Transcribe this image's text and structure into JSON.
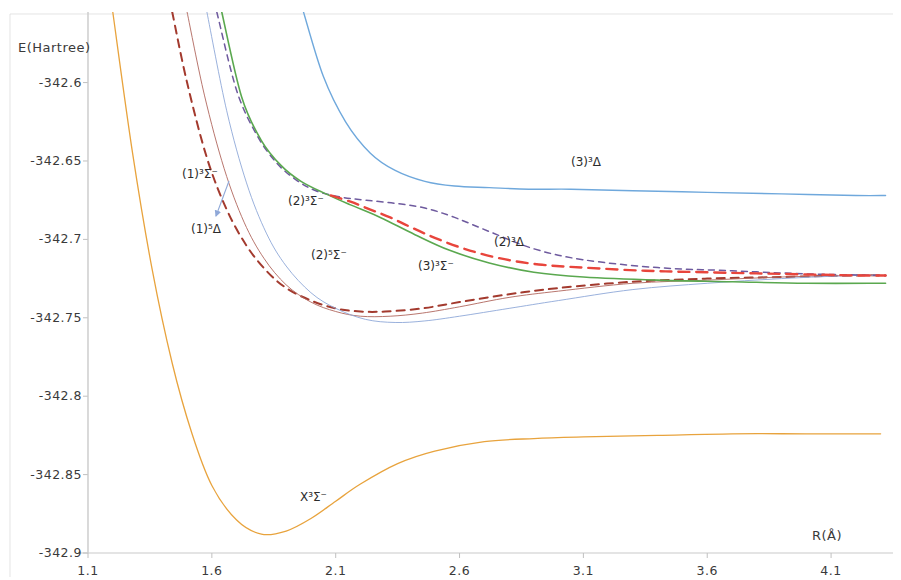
{
  "figure": {
    "background": "#ffffff",
    "ylabel": "E(Hartree)",
    "xlabel": "R(Å)"
  },
  "chart_data": {
    "type": "line",
    "title": "",
    "subtitle": "",
    "xlabel": "R(Å)",
    "ylabel": "E(Hartree)",
    "xlim": [
      1.1,
      4.35
    ],
    "ylim": [
      -342.9,
      -342.555
    ],
    "xticks": [
      "1.1",
      "1.6",
      "2.1",
      "2.6",
      "3.1",
      "3.6",
      "4.1"
    ],
    "xtick_values": [
      1.1,
      1.6,
      2.1,
      2.6,
      3.1,
      3.6,
      4.1
    ],
    "yticks": [
      "-342.6",
      "-342.65",
      "-342.7",
      "-342.75",
      "-342.8",
      "-342.85",
      "-342.9"
    ],
    "ytick_values": [
      -342.6,
      -342.65,
      -342.7,
      -342.75,
      -342.8,
      -342.85,
      -342.9
    ],
    "grid": false,
    "legend": "inline-annotations",
    "series": [
      {
        "name": "X3Sigma-",
        "label": "X³Σ⁻",
        "color": "#e8a33d",
        "style": "solid",
        "width": 1.3,
        "x": [
          1.2,
          1.28,
          1.36,
          1.44,
          1.52,
          1.6,
          1.7,
          1.8,
          1.9,
          2.0,
          2.1,
          2.2,
          2.35,
          2.5,
          2.7,
          2.9,
          3.1,
          3.4,
          3.7,
          4.0,
          4.3
        ],
        "y": [
          -342.555,
          -342.645,
          -342.72,
          -342.779,
          -342.824,
          -342.857,
          -342.879,
          -342.888,
          -342.886,
          -342.878,
          -342.867,
          -342.856,
          -342.843,
          -342.835,
          -342.829,
          -342.827,
          -342.826,
          -342.825,
          -342.824,
          -342.824,
          -342.824
        ]
      },
      {
        "name": "1-3Sigma-",
        "label": "(1)³Σ⁻",
        "color": "#a33a2e",
        "style": "dashed",
        "width": 2.0,
        "x": [
          1.44,
          1.5,
          1.58,
          1.66,
          1.74,
          1.82,
          1.9,
          2.0,
          2.1,
          2.2,
          2.3,
          2.45,
          2.6,
          2.8,
          3.0,
          3.3,
          3.6,
          3.9,
          4.2,
          4.32
        ],
        "y": [
          -342.555,
          -342.6,
          -342.648,
          -342.681,
          -342.704,
          -342.72,
          -342.731,
          -342.739,
          -342.744,
          -342.746,
          -342.746,
          -342.744,
          -342.74,
          -342.735,
          -342.731,
          -342.727,
          -342.725,
          -342.724,
          -342.723,
          -342.723
        ]
      },
      {
        "name": "1-5Delta",
        "label": "(1)⁵Δ",
        "color": "#b0675e",
        "style": "solid",
        "width": 0.9,
        "x": [
          1.5,
          1.57,
          1.65,
          1.73,
          1.81,
          1.9,
          2.0,
          2.1,
          2.2,
          2.32,
          2.45,
          2.6,
          2.8,
          3.0,
          3.3,
          3.6,
          3.9,
          4.2,
          4.32
        ],
        "y": [
          -342.555,
          -342.608,
          -342.655,
          -342.689,
          -342.712,
          -342.729,
          -342.74,
          -342.746,
          -342.749,
          -342.749,
          -342.747,
          -342.743,
          -342.737,
          -342.733,
          -342.728,
          -342.726,
          -342.724,
          -342.723,
          -342.723
        ]
      },
      {
        "name": "2-5Sigma-",
        "label": "(2)⁵Σ⁻",
        "color": "#8fa8d8",
        "style": "solid",
        "width": 0.9,
        "x": [
          1.58,
          1.66,
          1.74,
          1.82,
          1.9,
          2.0,
          2.1,
          2.22,
          2.34,
          2.46,
          2.6,
          2.8,
          3.0,
          3.3,
          3.6,
          3.9,
          4.2,
          4.32
        ],
        "y": [
          -342.555,
          -342.618,
          -342.664,
          -342.696,
          -342.717,
          -342.734,
          -342.744,
          -342.751,
          -342.753,
          -342.752,
          -342.749,
          -342.744,
          -342.739,
          -342.732,
          -342.728,
          -342.725,
          -342.723,
          -342.723
        ]
      },
      {
        "name": "2-3Sigma-",
        "label": "(2)³Σ⁻",
        "color": "#6e5a9e",
        "style": "dashed",
        "width": 1.5,
        "x": [
          1.62,
          1.7,
          1.78,
          1.86,
          1.94,
          2.02,
          2.12,
          2.22,
          2.34,
          2.46,
          2.58,
          2.72,
          2.9,
          3.1,
          3.4,
          3.7,
          4.0,
          4.32
        ],
        "y": [
          -342.555,
          -342.605,
          -342.633,
          -342.651,
          -342.662,
          -342.669,
          -342.673,
          -342.675,
          -342.677,
          -342.68,
          -342.686,
          -342.695,
          -342.706,
          -342.713,
          -342.718,
          -342.72,
          -342.722,
          -342.723
        ]
      },
      {
        "name": "3-3Sigma-",
        "label": "(3)³Σ⁻",
        "color": "#5aa84f",
        "style": "solid",
        "width": 1.6,
        "x": [
          1.64,
          1.72,
          1.8,
          1.88,
          1.96,
          2.06,
          2.16,
          2.28,
          2.42,
          2.56,
          2.72,
          2.9,
          3.1,
          3.4,
          3.7,
          4.0,
          4.32
        ],
        "y": [
          -342.555,
          -342.609,
          -342.637,
          -342.653,
          -342.663,
          -342.671,
          -342.678,
          -342.686,
          -342.697,
          -342.707,
          -342.715,
          -342.721,
          -342.724,
          -342.726,
          -342.727,
          -342.728,
          -342.728
        ]
      },
      {
        "name": "3-3Delta",
        "label": "(3)³Δ",
        "color": "#6fa8dc",
        "style": "solid",
        "width": 1.4,
        "x": [
          1.97,
          2.05,
          2.14,
          2.24,
          2.34,
          2.46,
          2.58,
          2.72,
          2.88,
          3.05,
          3.3,
          3.6,
          3.9,
          4.2,
          4.32
        ],
        "y": [
          -342.555,
          -342.596,
          -342.625,
          -342.645,
          -342.656,
          -342.663,
          -342.666,
          -342.667,
          -342.668,
          -342.668,
          -342.669,
          -342.67,
          -342.671,
          -342.672,
          -342.672
        ]
      },
      {
        "name": "2-3Delta",
        "label": "(2)³Δ",
        "color": "#e8453c",
        "style": "dashed",
        "width": 2.4,
        "x": [
          2.08,
          2.16,
          2.24,
          2.32,
          2.4,
          2.5,
          2.62,
          2.76,
          2.92,
          3.1,
          3.35,
          3.6,
          3.9,
          4.2,
          4.32
        ],
        "y": [
          -342.672,
          -342.676,
          -342.681,
          -342.686,
          -342.692,
          -342.699,
          -342.706,
          -342.712,
          -342.716,
          -342.718,
          -342.72,
          -342.721,
          -342.722,
          -342.723,
          -342.723
        ]
      }
    ],
    "annotations": [
      {
        "name": "label-1-3sigma",
        "text": "(1)³Σ⁻",
        "x_px": 182,
        "y_px": 167
      },
      {
        "name": "label-1-5delta",
        "text": "(1)⁵Δ",
        "x_px": 191,
        "y_px": 222
      },
      {
        "name": "label-2-3sigma",
        "text": "(2)³Σ⁻",
        "x_px": 288,
        "y_px": 194
      },
      {
        "name": "label-2-5sigma",
        "text": "(2)⁵Σ⁻",
        "x_px": 311,
        "y_px": 248
      },
      {
        "name": "label-3-3sigma",
        "text": "(3)³Σ⁻",
        "x_px": 418,
        "y_px": 259
      },
      {
        "name": "label-3-3delta",
        "text": "(3)³Δ",
        "x_px": 571,
        "y_px": 155
      },
      {
        "name": "label-2-3delta",
        "text": "(2)³Δ",
        "x_px": 494,
        "y_px": 235
      },
      {
        "name": "label-x-3sigma",
        "text": "X³Σ⁻",
        "x_px": 300,
        "y_px": 490
      }
    ],
    "arrow": {
      "name": "leader-arrow-1-5delta",
      "from_px": [
        229,
        181
      ],
      "to_px": [
        216,
        216
      ],
      "color": "#8fa8d8"
    }
  }
}
